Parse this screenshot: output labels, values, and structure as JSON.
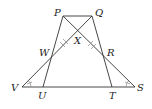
{
  "diagram": {
    "type": "geometry",
    "points": {
      "P": {
        "label": "P"
      },
      "Q": {
        "label": "Q"
      },
      "X": {
        "label": "X"
      },
      "W": {
        "label": "W"
      },
      "R": {
        "label": "R"
      },
      "V": {
        "label": "V"
      },
      "S": {
        "label": "S"
      },
      "U": {
        "label": "U"
      },
      "T": {
        "label": "T"
      }
    },
    "segments": [
      "PQ",
      "PU",
      "QT",
      "VQ",
      "PS",
      "VS"
    ],
    "congruence_marks": [
      "WX ≅ XR (double ticks)",
      "angle V ≅ angle S (ticked arcs)"
    ]
  }
}
